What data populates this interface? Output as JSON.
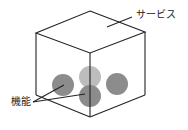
{
  "diagram": {
    "labels": {
      "service": "サービス",
      "function": "機能"
    },
    "colors": {
      "line": "#222222",
      "circle_dark": "#8c8c8c",
      "circle_light": "#bdbdbd"
    },
    "circles": [
      {
        "id": "left",
        "cx": 63,
        "cy": 85,
        "r": 11,
        "shade": "dark"
      },
      {
        "id": "top-center",
        "cx": 90,
        "cy": 77,
        "r": 11,
        "shade": "light"
      },
      {
        "id": "bottom-center",
        "cx": 90,
        "cy": 96,
        "r": 11,
        "shade": "dark"
      },
      {
        "id": "right",
        "cx": 117,
        "cy": 84,
        "r": 11,
        "shade": "dark"
      }
    ]
  }
}
